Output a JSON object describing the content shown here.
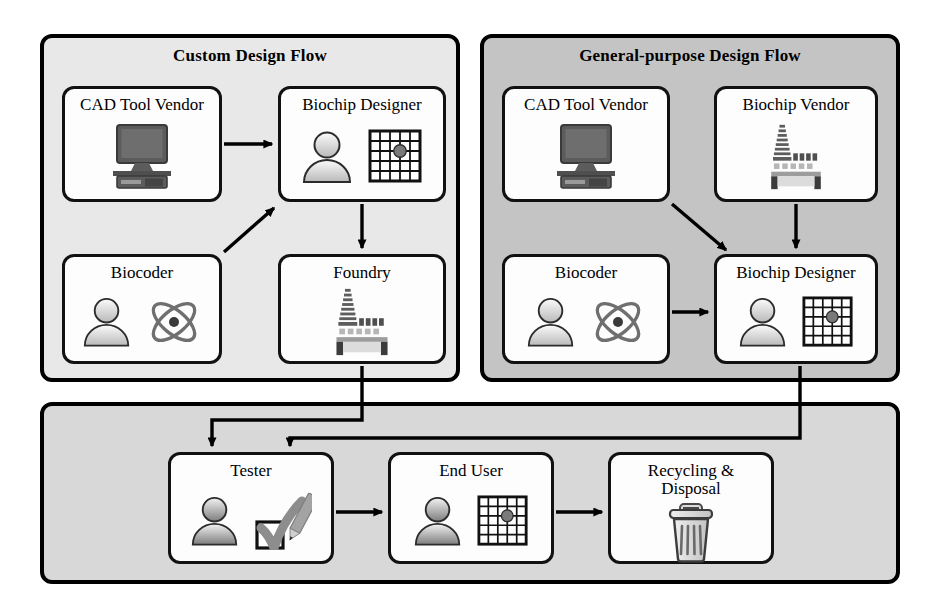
{
  "figure": {
    "title_custom": "Custom Design Flow",
    "title_general": "General-purpose Design Flow"
  },
  "panels": [
    {
      "id": "custom",
      "label": "Custom Design Flow",
      "bg": "#e8e8e8"
    },
    {
      "id": "general",
      "label": "General-purpose Design Flow",
      "bg": "#c4c4c4"
    },
    {
      "id": "bottom",
      "label": "",
      "bg": "#d8d8d8"
    }
  ],
  "nodes": {
    "custom_cad": {
      "label": "CAD Tool Vendor",
      "icons": [
        "monitor-icon"
      ]
    },
    "custom_designer": {
      "label": "Biochip Designer",
      "icons": [
        "person-icon",
        "biochip-grid-icon"
      ]
    },
    "custom_biocoder": {
      "label": "Biocoder",
      "icons": [
        "person-icon",
        "atom-icon"
      ]
    },
    "custom_foundry": {
      "label": "Foundry",
      "icons": [
        "factory-icon"
      ]
    },
    "general_cad": {
      "label": "CAD Tool Vendor",
      "icons": [
        "monitor-icon"
      ]
    },
    "general_vendor": {
      "label": "Biochip Vendor",
      "icons": [
        "factory-icon"
      ]
    },
    "general_biocoder": {
      "label": "Biocoder",
      "icons": [
        "person-icon",
        "atom-icon"
      ]
    },
    "general_designer": {
      "label": "Biochip Designer",
      "icons": [
        "person-icon",
        "biochip-grid-icon"
      ]
    },
    "bottom_tester": {
      "label": "Tester",
      "icons": [
        "person-icon",
        "checklist-pen-icon"
      ]
    },
    "bottom_enduser": {
      "label": "End User",
      "icons": [
        "person-icon",
        "biochip-grid-icon"
      ]
    },
    "bottom_recycling": {
      "label": "Recycling &\nDisposal",
      "icons": [
        "trashcan-icon"
      ]
    }
  },
  "flows": [
    {
      "from": "custom_cad",
      "to": "custom_designer"
    },
    {
      "from": "custom_biocoder",
      "to": "custom_designer"
    },
    {
      "from": "custom_designer",
      "to": "custom_foundry"
    },
    {
      "from": "general_cad",
      "to": "general_designer"
    },
    {
      "from": "general_vendor",
      "to": "general_designer"
    },
    {
      "from": "general_biocoder",
      "to": "general_designer"
    },
    {
      "from": "custom_foundry",
      "to": "bottom_tester"
    },
    {
      "from": "general_designer",
      "to": "bottom_tester"
    },
    {
      "from": "bottom_tester",
      "to": "bottom_enduser"
    },
    {
      "from": "bottom_enduser",
      "to": "bottom_recycling"
    }
  ],
  "colors": {
    "stroke": "#000000",
    "card_fill": "#fdfdfd",
    "panel_light": "#e8e8e8",
    "panel_dark": "#c4c4c4",
    "panel_bottom": "#d8d8d8",
    "icon_gray": "#808080",
    "icon_dark": "#4d4d4d"
  }
}
